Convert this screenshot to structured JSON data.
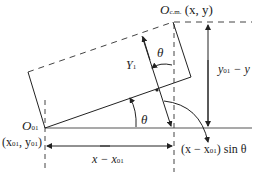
{
  "diagram": {
    "labels": {
      "ocm_O": "O",
      "ocm_sub": "c.m.",
      "ocm_coords": "(x, y)",
      "o01_O": "O",
      "o01_sub": "01",
      "o01_coords_open": "(x",
      "o01_coords_sub1": "01",
      "o01_coords_mid": ", y",
      "o01_coords_sub2": "01",
      "o01_coords_close": ")",
      "y1_Y": "Y",
      "y1_sub": "1",
      "theta_top": "θ",
      "theta_bottom": "θ",
      "dy_y": "y",
      "dy_sub": "01",
      "dy_rest": " − y",
      "dx_x": "x − x",
      "dx_sub": "01",
      "proj_open": "(x − x",
      "proj_sub": "01",
      "proj_close": ") sin θ"
    },
    "colors": {
      "line": "#222222",
      "dash": "#444444",
      "baseline": "#555555"
    }
  }
}
